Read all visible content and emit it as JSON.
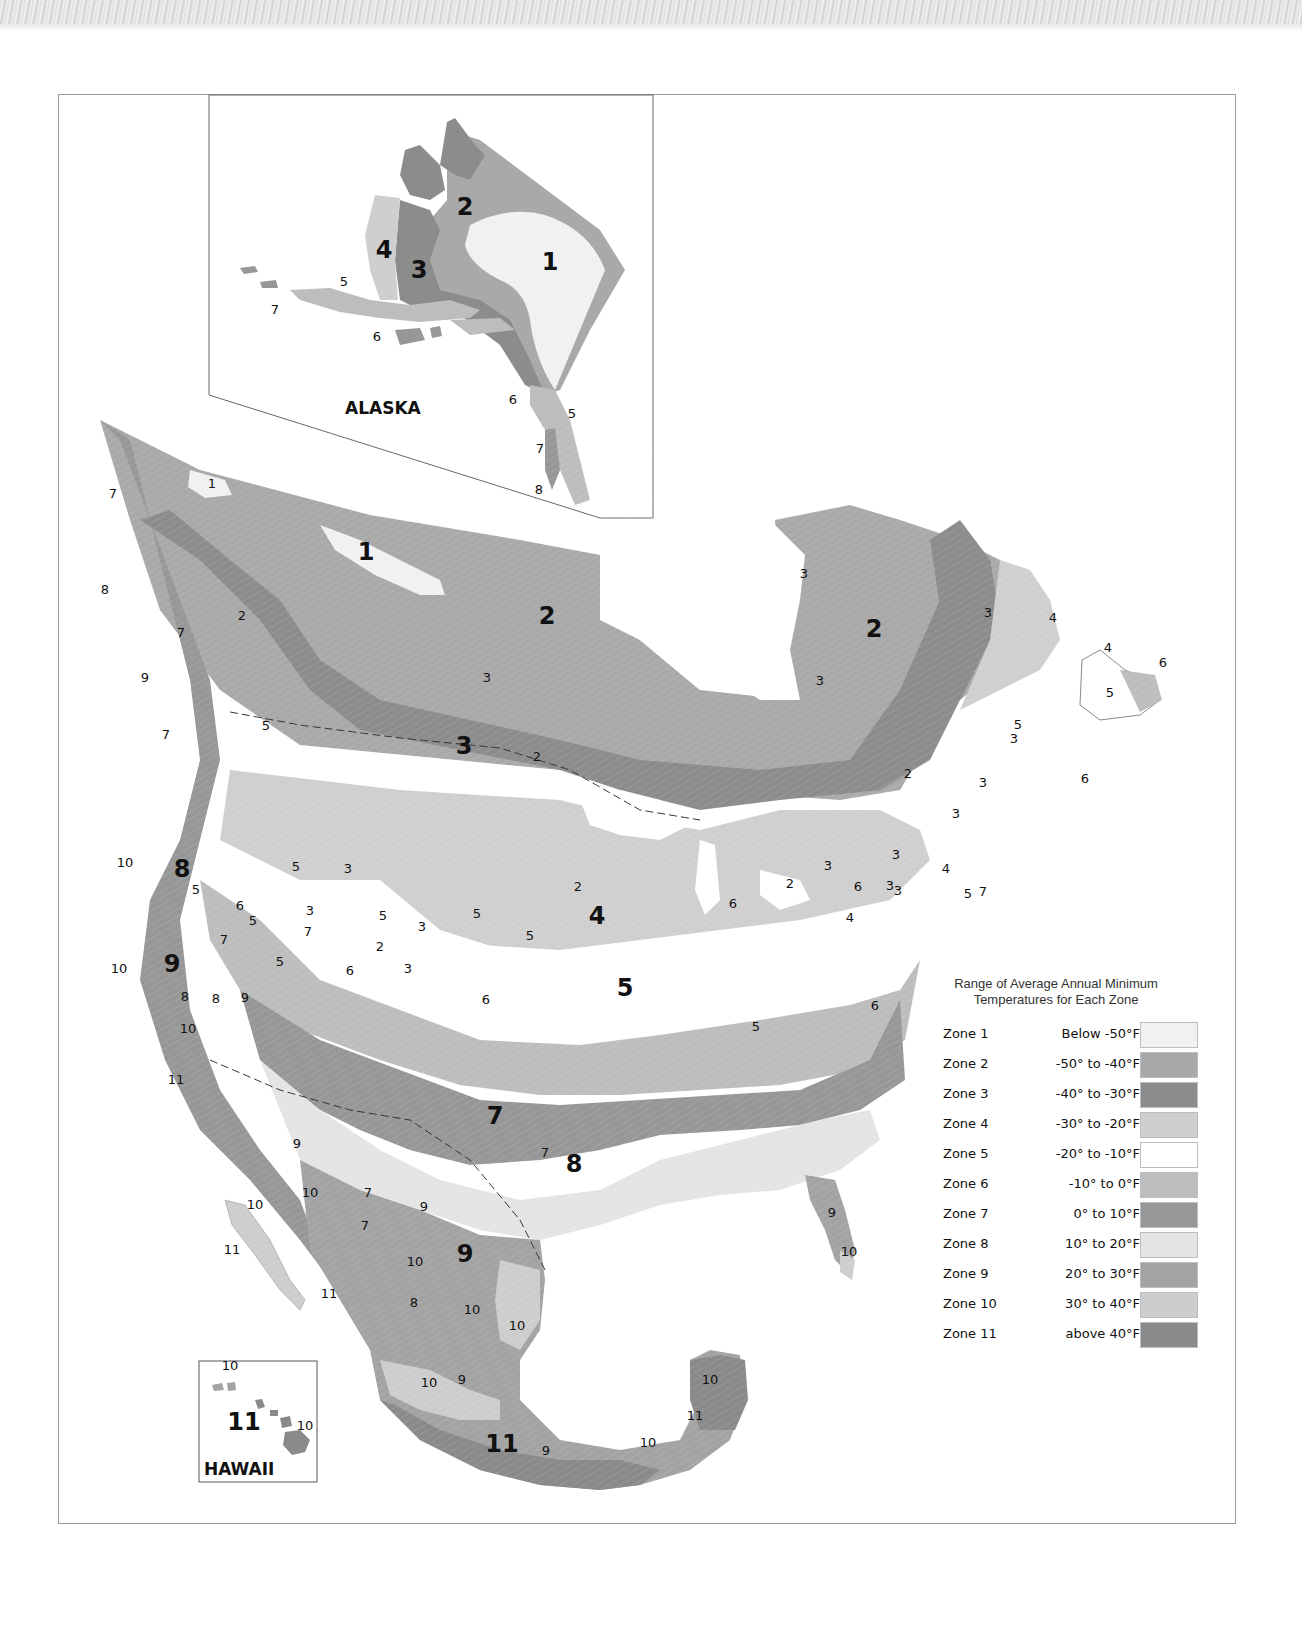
{
  "map": {
    "title_region": "North America plant hardiness zones",
    "insets": {
      "alaska": {
        "label": "ALASKA"
      },
      "hawaii": {
        "label": "HAWAII"
      }
    }
  },
  "legend": {
    "title_line1": "Range of Average Annual Minimum",
    "title_line2": "Temperatures for Each Zone",
    "zones": [
      {
        "zone": "Zone 1",
        "range": "Below -50°F",
        "color": "#f1f1f1"
      },
      {
        "zone": "Zone 2",
        "range": "-50° to -40°F",
        "color": "#a9a9a9"
      },
      {
        "zone": "Zone 3",
        "range": "-40° to -30°F",
        "color": "#8c8c8c"
      },
      {
        "zone": "Zone 4",
        "range": "-30° to -20°F",
        "color": "#cfcfcf"
      },
      {
        "zone": "Zone 5",
        "range": "-20° to -10°F",
        "color": "#ffffff"
      },
      {
        "zone": "Zone 6",
        "range": "-10° to 0°F",
        "color": "#bdbdbd"
      },
      {
        "zone": "Zone 7",
        "range": "0° to 10°F",
        "color": "#979797"
      },
      {
        "zone": "Zone 8",
        "range": "10° to 20°F",
        "color": "#e4e4e4"
      },
      {
        "zone": "Zone 9",
        "range": "20° to 30°F",
        "color": "#a3a3a3"
      },
      {
        "zone": "Zone 10",
        "range": "30° to 40°F",
        "color": "#cdcdcd"
      },
      {
        "zone": "Zone 11",
        "range": "above 40°F",
        "color": "#8a8a8a"
      }
    ]
  },
  "labels": {
    "alaska": [
      {
        "t": "2",
        "x": 465,
        "y": 215,
        "big": true
      },
      {
        "t": "1",
        "x": 550,
        "y": 270,
        "big": true
      },
      {
        "t": "4",
        "x": 384,
        "y": 258,
        "big": true
      },
      {
        "t": "3",
        "x": 419,
        "y": 278,
        "big": true
      },
      {
        "t": "5",
        "x": 344,
        "y": 286
      },
      {
        "t": "7",
        "x": 275,
        "y": 314
      },
      {
        "t": "6",
        "x": 377,
        "y": 341
      },
      {
        "t": "6",
        "x": 513,
        "y": 404
      },
      {
        "t": "5",
        "x": 572,
        "y": 418
      },
      {
        "t": "7",
        "x": 540,
        "y": 453
      },
      {
        "t": "8",
        "x": 539,
        "y": 494
      }
    ],
    "main": [
      {
        "t": "1",
        "x": 212,
        "y": 488
      },
      {
        "t": "1",
        "x": 366,
        "y": 560,
        "big": true
      },
      {
        "t": "2",
        "x": 547,
        "y": 624,
        "big": true
      },
      {
        "t": "2",
        "x": 874,
        "y": 637,
        "big": true
      },
      {
        "t": "3",
        "x": 464,
        "y": 754,
        "big": true
      },
      {
        "t": "3",
        "x": 988,
        "y": 617
      },
      {
        "t": "3",
        "x": 804,
        "y": 578
      },
      {
        "t": "3",
        "x": 820,
        "y": 685
      },
      {
        "t": "4",
        "x": 1053,
        "y": 622
      },
      {
        "t": "4",
        "x": 1108,
        "y": 652
      },
      {
        "t": "6",
        "x": 1163,
        "y": 667
      },
      {
        "t": "5",
        "x": 1110,
        "y": 697,
        "big": false
      },
      {
        "t": "7",
        "x": 113,
        "y": 498
      },
      {
        "t": "8",
        "x": 105,
        "y": 594
      },
      {
        "t": "2",
        "x": 242,
        "y": 620
      },
      {
        "t": "7",
        "x": 181,
        "y": 637
      },
      {
        "t": "9",
        "x": 145,
        "y": 682
      },
      {
        "t": "5",
        "x": 266,
        "y": 730
      },
      {
        "t": "7",
        "x": 166,
        "y": 739
      },
      {
        "t": "3",
        "x": 487,
        "y": 682
      },
      {
        "t": "2",
        "x": 537,
        "y": 761
      },
      {
        "t": "2",
        "x": 578,
        "y": 891
      },
      {
        "t": "2",
        "x": 790,
        "y": 888
      },
      {
        "t": "3",
        "x": 828,
        "y": 870,
        "big": false
      },
      {
        "t": "8",
        "x": 182,
        "y": 877,
        "big": true
      },
      {
        "t": "5",
        "x": 296,
        "y": 871
      },
      {
        "t": "3",
        "x": 348,
        "y": 873
      },
      {
        "t": "5",
        "x": 383,
        "y": 920
      },
      {
        "t": "3",
        "x": 310,
        "y": 915
      },
      {
        "t": "5",
        "x": 253,
        "y": 925
      },
      {
        "t": "3",
        "x": 422,
        "y": 931
      },
      {
        "t": "5",
        "x": 477,
        "y": 918
      },
      {
        "t": "2",
        "x": 380,
        "y": 951
      },
      {
        "t": "4",
        "x": 597,
        "y": 924,
        "big": true
      },
      {
        "t": "5",
        "x": 530,
        "y": 940
      },
      {
        "t": "6",
        "x": 733,
        "y": 908
      },
      {
        "t": "3",
        "x": 898,
        "y": 895
      },
      {
        "t": "4",
        "x": 946,
        "y": 873,
        "big": false
      },
      {
        "t": "5",
        "x": 968,
        "y": 898
      },
      {
        "t": "3",
        "x": 896,
        "y": 859
      },
      {
        "t": "3",
        "x": 983,
        "y": 787
      },
      {
        "t": "5",
        "x": 1018,
        "y": 729
      },
      {
        "t": "3",
        "x": 1014,
        "y": 743
      },
      {
        "t": "2",
        "x": 908,
        "y": 778
      },
      {
        "t": "3",
        "x": 956,
        "y": 818
      },
      {
        "t": "6",
        "x": 1085,
        "y": 783
      },
      {
        "t": "3",
        "x": 890,
        "y": 890
      },
      {
        "t": "10",
        "x": 125,
        "y": 867
      },
      {
        "t": "5",
        "x": 196,
        "y": 894
      },
      {
        "t": "6",
        "x": 240,
        "y": 910,
        "big": false
      },
      {
        "t": "7",
        "x": 224,
        "y": 944
      },
      {
        "t": "7",
        "x": 308,
        "y": 936
      },
      {
        "t": "5",
        "x": 280,
        "y": 966
      },
      {
        "t": "10",
        "x": 119,
        "y": 973
      },
      {
        "t": "9",
        "x": 172,
        "y": 972,
        "big": true
      },
      {
        "t": "6",
        "x": 350,
        "y": 975
      },
      {
        "t": "3",
        "x": 408,
        "y": 973
      },
      {
        "t": "8",
        "x": 185,
        "y": 1001
      },
      {
        "t": "8",
        "x": 216,
        "y": 1003
      },
      {
        "t": "9",
        "x": 245,
        "y": 1002
      },
      {
        "t": "6",
        "x": 486,
        "y": 1004
      },
      {
        "t": "5",
        "x": 625,
        "y": 996,
        "big": true
      },
      {
        "t": "6",
        "x": 875,
        "y": 1010
      },
      {
        "t": "5",
        "x": 756,
        "y": 1031
      },
      {
        "t": "6",
        "x": 858,
        "y": 891
      },
      {
        "t": "4",
        "x": 850,
        "y": 922
      },
      {
        "t": "7",
        "x": 983,
        "y": 896
      },
      {
        "t": "10",
        "x": 188,
        "y": 1033
      },
      {
        "t": "11",
        "x": 176,
        "y": 1084
      },
      {
        "t": "7",
        "x": 495,
        "y": 1124,
        "big": true
      },
      {
        "t": "7",
        "x": 545,
        "y": 1157
      },
      {
        "t": "8",
        "x": 574,
        "y": 1172,
        "big": true
      },
      {
        "t": "9",
        "x": 297,
        "y": 1148
      },
      {
        "t": "10",
        "x": 310,
        "y": 1197
      },
      {
        "t": "7",
        "x": 368,
        "y": 1197
      },
      {
        "t": "9",
        "x": 424,
        "y": 1211
      },
      {
        "t": "7",
        "x": 365,
        "y": 1230
      },
      {
        "t": "9",
        "x": 465,
        "y": 1262,
        "big": true
      },
      {
        "t": "10",
        "x": 415,
        "y": 1266
      },
      {
        "t": "10",
        "x": 255,
        "y": 1209
      },
      {
        "t": "11",
        "x": 232,
        "y": 1254
      },
      {
        "t": "11",
        "x": 329,
        "y": 1298
      },
      {
        "t": "8",
        "x": 414,
        "y": 1307
      },
      {
        "t": "10",
        "x": 472,
        "y": 1314
      },
      {
        "t": "10",
        "x": 517,
        "y": 1330
      },
      {
        "t": "9",
        "x": 832,
        "y": 1217
      },
      {
        "t": "10",
        "x": 849,
        "y": 1256
      },
      {
        "t": "10",
        "x": 429,
        "y": 1387
      },
      {
        "t": "9",
        "x": 462,
        "y": 1384
      },
      {
        "t": "10",
        "x": 710,
        "y": 1384
      },
      {
        "t": "11",
        "x": 695,
        "y": 1420
      },
      {
        "t": "11",
        "x": 502,
        "y": 1452,
        "big": true
      },
      {
        "t": "9",
        "x": 546,
        "y": 1455
      },
      {
        "t": "10",
        "x": 648,
        "y": 1447
      }
    ],
    "hawaii": [
      {
        "t": "10",
        "x": 230,
        "y": 1370
      },
      {
        "t": "11",
        "x": 244,
        "y": 1430,
        "big": true
      },
      {
        "t": "10",
        "x": 305,
        "y": 1430
      }
    ]
  }
}
